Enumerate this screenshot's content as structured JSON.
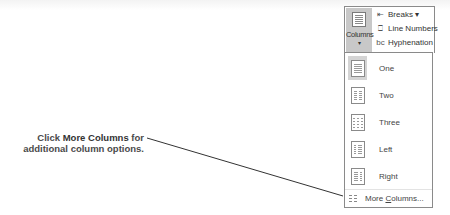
{
  "callout": {
    "prefix": "Click ",
    "bold": "More Columns",
    "suffix": " for additional column options."
  },
  "ribbon": {
    "columns_button": {
      "label": "Columns",
      "caret": "▾",
      "icon": "columns-icon"
    },
    "side_items": [
      {
        "label": "Breaks ▾",
        "icon": "breaks-icon"
      },
      {
        "label": "Line Numbers",
        "icon": "line-numbers-icon"
      },
      {
        "label": "Hyphenation",
        "icon": "hyphenation-icon"
      }
    ]
  },
  "menu": {
    "items": [
      {
        "label": "One",
        "icon": "one-column-icon",
        "selected": true
      },
      {
        "label": "Two",
        "icon": "two-columns-icon",
        "selected": false
      },
      {
        "label": "Three",
        "icon": "three-columns-icon",
        "selected": false
      },
      {
        "label": "Left",
        "icon": "left-column-icon",
        "selected": false
      },
      {
        "label": "Right",
        "icon": "right-column-icon",
        "selected": false
      }
    ],
    "more": {
      "label_pre": "More ",
      "label_accel": "C",
      "label_post": "olumns...",
      "icon": "more-columns-icon"
    }
  }
}
